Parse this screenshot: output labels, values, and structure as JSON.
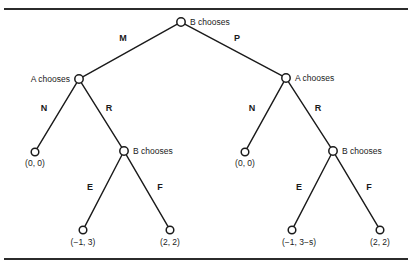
{
  "figure": {
    "caption_stub": "",
    "background": "#ffffff",
    "line_color": "#1a1a1a",
    "rule_color": "#2b2b2b"
  },
  "chart_data": {
    "type": "diagram",
    "subtype": "extensive-form-game-tree",
    "title": "",
    "players": [
      "A",
      "B"
    ],
    "nodes": [
      {
        "id": "root",
        "label": "B chooses",
        "player": "B",
        "x": 181,
        "y": 22,
        "label_anchor": "start",
        "label_dx": 9,
        "label_dy": 3
      },
      {
        "id": "L-A",
        "label": "A chooses",
        "player": "A",
        "x": 79,
        "y": 79,
        "label_anchor": "end",
        "label_dx": -9,
        "label_dy": 3
      },
      {
        "id": "R-A",
        "label": "A chooses",
        "player": "A",
        "x": 286,
        "y": 78,
        "label_anchor": "start",
        "label_dx": 9,
        "label_dy": 3
      },
      {
        "id": "L-N-leaf",
        "label": "",
        "player": "",
        "x": 35,
        "y": 152,
        "label_anchor": "middle",
        "label_dx": 0,
        "label_dy": 0
      },
      {
        "id": "L-B",
        "label": "B chooses",
        "player": "B",
        "x": 124,
        "y": 151,
        "label_anchor": "start",
        "label_dx": 9,
        "label_dy": 3
      },
      {
        "id": "R-N-leaf",
        "label": "",
        "player": "",
        "x": 245,
        "y": 152,
        "label_anchor": "middle",
        "label_dx": 0,
        "label_dy": 0
      },
      {
        "id": "R-B",
        "label": "B chooses",
        "player": "B",
        "x": 333,
        "y": 151,
        "label_anchor": "start",
        "label_dx": 9,
        "label_dy": 3
      },
      {
        "id": "L-E-leaf",
        "label": "",
        "player": "",
        "x": 83,
        "y": 230,
        "label_anchor": "middle",
        "label_dx": 0,
        "label_dy": 0
      },
      {
        "id": "L-F-leaf",
        "label": "",
        "player": "",
        "x": 170,
        "y": 230,
        "label_anchor": "middle",
        "label_dx": 0,
        "label_dy": 0
      },
      {
        "id": "R-E-leaf",
        "label": "",
        "player": "",
        "x": 292,
        "y": 230,
        "label_anchor": "middle",
        "label_dx": 0,
        "label_dy": 0
      },
      {
        "id": "R-F-leaf",
        "label": "",
        "player": "",
        "x": 380,
        "y": 230,
        "label_anchor": "middle",
        "label_dx": 0,
        "label_dy": 0
      }
    ],
    "edges": [
      {
        "id": "e-root-LA",
        "from": "root",
        "to": "L-A",
        "label": "M",
        "label_x": 123,
        "label_y": 41
      },
      {
        "id": "e-root-RA",
        "from": "root",
        "to": "R-A",
        "label": "P",
        "label_x": 237,
        "label_y": 41
      },
      {
        "id": "e-LA-N",
        "from": "L-A",
        "to": "L-N-leaf",
        "label": "N",
        "label_x": 44,
        "label_y": 111
      },
      {
        "id": "e-LA-R",
        "from": "L-A",
        "to": "L-B",
        "label": "R",
        "label_x": 109,
        "label_y": 111
      },
      {
        "id": "e-RA-N",
        "from": "R-A",
        "to": "R-N-leaf",
        "label": "N",
        "label_x": 252,
        "label_y": 111
      },
      {
        "id": "e-RA-R",
        "from": "R-A",
        "to": "R-B",
        "label": "R",
        "label_x": 318,
        "label_y": 111
      },
      {
        "id": "e-LB-E",
        "from": "L-B",
        "to": "L-E-leaf",
        "label": "E",
        "label_x": 90,
        "label_y": 190
      },
      {
        "id": "e-LB-F",
        "from": "L-B",
        "to": "L-F-leaf",
        "label": "F",
        "label_x": 160,
        "label_y": 190
      },
      {
        "id": "e-RB-E",
        "from": "R-B",
        "to": "R-E-leaf",
        "label": "E",
        "label_x": 299,
        "label_y": 190
      },
      {
        "id": "e-RB-F",
        "from": "R-B",
        "to": "R-F-leaf",
        "label": "F",
        "label_x": 369,
        "label_y": 190
      }
    ],
    "payoffs": [
      {
        "id": "p-L-N",
        "node": "L-N-leaf",
        "text": "(0, 0)",
        "x": 35,
        "y": 166
      },
      {
        "id": "p-R-N",
        "node": "R-N-leaf",
        "text": "(0, 0)",
        "x": 245,
        "y": 166
      },
      {
        "id": "p-L-E",
        "node": "L-E-leaf",
        "text": "(−1, 3)",
        "x": 83,
        "y": 245
      },
      {
        "id": "p-L-F",
        "node": "L-F-leaf",
        "text": "(2, 2)",
        "x": 170,
        "y": 245
      },
      {
        "id": "p-R-E",
        "node": "R-E-leaf",
        "text": "(−1, 3−s)",
        "x": 299,
        "y": 245
      },
      {
        "id": "p-R-F",
        "node": "R-F-leaf",
        "text": "(2, 2)",
        "x": 380,
        "y": 245
      }
    ],
    "node_radius": 4.2,
    "leaf_radius": 3.8,
    "annotations": [
      "Root node: B chooses between M and P",
      "After M, A chooses between N and R; after P, A chooses between N and R",
      "After R on either side, B chooses between E and F"
    ]
  }
}
